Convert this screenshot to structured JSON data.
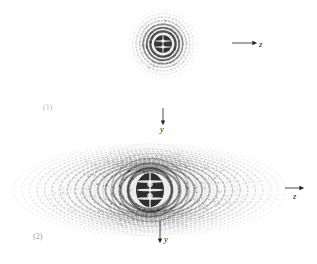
{
  "figure": {
    "background_color": "#ffffff",
    "ink_color": "#1a1a1a",
    "panels": [
      {
        "index_label": "(1)",
        "index_x": 43,
        "index_y": 104,
        "pattern": {
          "name": "concentric-ring-diffraction-pattern",
          "shape": "circular",
          "center_x": 163,
          "center_y": 44,
          "core_radius_x": 9,
          "core_radius_y": 9,
          "ring_count": 7,
          "ring_spacing": 4.1,
          "lobe_count": 2,
          "outer_radius_x": 34,
          "outer_radius_y": 34,
          "max_opacity": 0.92
        },
        "axes": [
          {
            "name": "z-axis",
            "label": "z",
            "direction": "right",
            "x1": 232,
            "y1": 43,
            "x2": 254,
            "y2": 43,
            "label_x": 259,
            "label_y": 40
          },
          {
            "name": "y-axis",
            "label": "y",
            "direction": "down",
            "x1": 163,
            "y1": 108,
            "x2": 163,
            "y2": 122,
            "label_x": 160,
            "label_y": 125
          }
        ]
      },
      {
        "index_label": "(2)",
        "index_x": 33,
        "index_y": 233,
        "pattern": {
          "name": "elliptical-interference-pattern",
          "shape": "elliptical",
          "center_x": 150,
          "center_y": 190,
          "core_radius_x": 14,
          "core_radius_y": 17,
          "ring_count": 16,
          "ring_spacing": 5.2,
          "lobe_count": 3,
          "outer_radius_x": 136,
          "outer_radius_y": 46,
          "max_opacity": 0.95
        },
        "axes": [
          {
            "name": "z-axis",
            "label": "z",
            "direction": "right",
            "x1": 285,
            "y1": 188,
            "x2": 301,
            "y2": 188,
            "label_x": 293,
            "label_y": 192
          },
          {
            "name": "y-axis",
            "label": "y",
            "direction": "down",
            "x1": 160,
            "y1": 221,
            "x2": 160,
            "y2": 240,
            "label_x": 164,
            "label_y": 235
          }
        ]
      }
    ]
  }
}
